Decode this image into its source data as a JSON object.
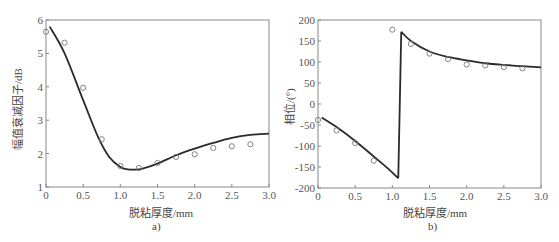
{
  "chart_data": [
    {
      "type": "line",
      "id": "a",
      "caption": "a)",
      "title": "",
      "xlabel": "脱粘厚度/mm",
      "ylabel": "幅值衰减因子/dB",
      "xlim": [
        0,
        3.0
      ],
      "ylim": [
        1,
        6
      ],
      "xticks": [
        "0",
        "0.5",
        "1.0",
        "1.5",
        "2.0",
        "2.5",
        "3.0"
      ],
      "yticks": [
        "1",
        "2",
        "3",
        "4",
        "5",
        "6"
      ],
      "grid": false,
      "legend": null,
      "series": [
        {
          "name": "theory",
          "style": "solid line",
          "x": [
            0.05,
            0.25,
            0.5,
            0.7,
            0.85,
            1.0,
            1.1,
            1.2,
            1.3,
            1.5,
            1.75,
            2.0,
            2.25,
            2.5,
            2.75,
            3.0
          ],
          "y": [
            5.8,
            5.0,
            3.6,
            2.5,
            1.9,
            1.6,
            1.53,
            1.52,
            1.55,
            1.7,
            1.95,
            2.15,
            2.32,
            2.47,
            2.56,
            2.6
          ]
        },
        {
          "name": "experiment",
          "style": "open circle markers",
          "x": [
            0,
            0.25,
            0.5,
            0.75,
            1.0,
            1.25,
            1.5,
            1.75,
            2.0,
            2.25,
            2.5,
            2.75
          ],
          "y": [
            5.65,
            5.32,
            3.97,
            2.43,
            1.63,
            1.57,
            1.72,
            1.9,
            1.98,
            2.17,
            2.22,
            2.28
          ]
        }
      ]
    },
    {
      "type": "line",
      "id": "b",
      "caption": "b)",
      "title": "",
      "xlabel": "脱粘厚度/mm",
      "ylabel": "相位/(°)",
      "xlim": [
        0,
        3.0
      ],
      "ylim": [
        -200,
        200
      ],
      "xticks": [
        "0",
        "0.5",
        "1.0",
        "1.5",
        "2.0",
        "2.5",
        "3.0"
      ],
      "yticks": [
        "-200",
        "-150",
        "-100",
        "-50",
        "0",
        "50",
        "100",
        "150",
        "200"
      ],
      "grid": false,
      "legend": null,
      "series": [
        {
          "name": "theory",
          "style": "solid line",
          "x": [
            0.05,
            0.25,
            0.5,
            0.75,
            0.95,
            1.08,
            1.12,
            1.25,
            1.5,
            1.75,
            2.0,
            2.25,
            2.5,
            2.75,
            3.0
          ],
          "y": [
            -32,
            -55,
            -88,
            -125,
            -155,
            -177,
            172,
            150,
            125,
            112,
            104,
            97,
            93,
            90,
            87
          ]
        },
        {
          "name": "experiment",
          "style": "open circle markers",
          "x": [
            0,
            0.25,
            0.5,
            0.75,
            1.0,
            1.25,
            1.5,
            1.75,
            2.0,
            2.25,
            2.5,
            2.75
          ],
          "y": [
            -38,
            -63,
            -93,
            -135,
            177,
            143,
            120,
            107,
            94,
            92,
            88,
            85
          ]
        }
      ]
    }
  ],
  "colors": {
    "line": "#2a2a2a",
    "marker": "#777777",
    "axis": "#888888"
  }
}
